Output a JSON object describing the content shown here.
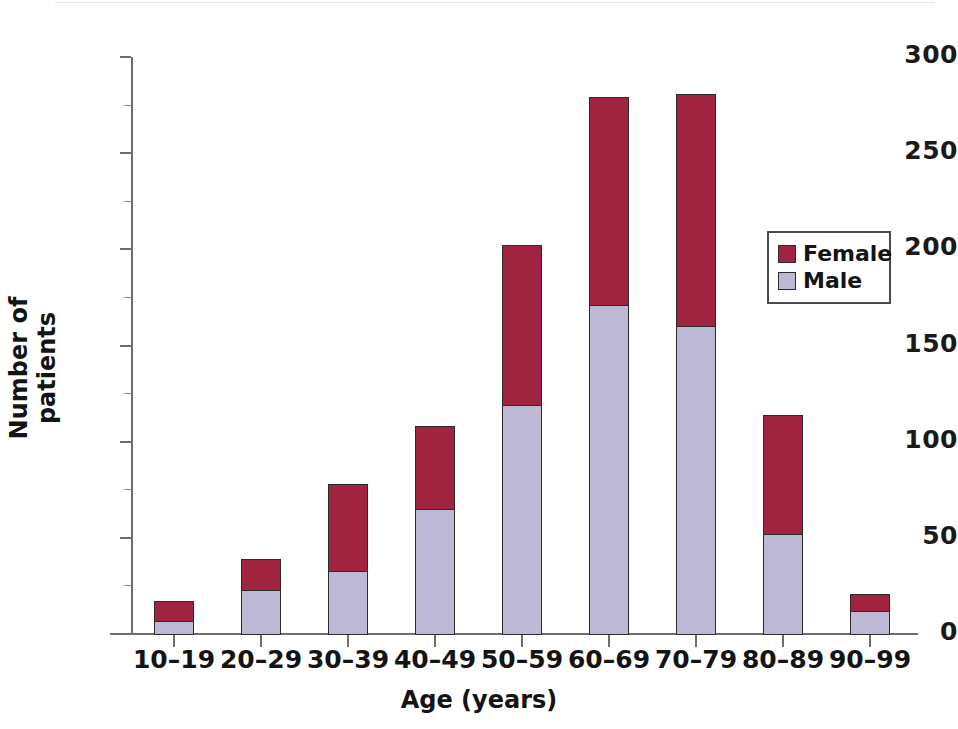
{
  "chart_data": {
    "type": "bar",
    "subtype": "stacked-vertical",
    "title": "",
    "xlabel": "Age (years)",
    "ylabel": "Number of patients",
    "categories": [
      "10–19",
      "20–29",
      "30–39",
      "40–49",
      "50–59",
      "60–69",
      "70–79",
      "80–89",
      "90–99"
    ],
    "series": [
      {
        "name": "Male",
        "values": [
          7,
          23,
          33,
          65,
          119,
          171,
          160,
          52,
          12
        ],
        "color": "#bdb8d4"
      },
      {
        "name": "Female",
        "values": [
          10,
          16,
          45,
          43,
          83,
          108,
          121,
          62,
          9
        ],
        "color": "#a0243f"
      }
    ],
    "totals": [
      17,
      39,
      78,
      108,
      202,
      279,
      281,
      114,
      21
    ],
    "ylim": [
      0,
      300
    ],
    "yticks": [
      0,
      50,
      100,
      150,
      200,
      250,
      300
    ],
    "ytick_labels": [
      "0",
      "50",
      "100",
      "150",
      "200",
      "250",
      "300"
    ],
    "yticks_minor": [
      25,
      75,
      125,
      175,
      225,
      275
    ],
    "grid": false,
    "legend_position": "upper right",
    "legend_entries": [
      "Female",
      "Male"
    ],
    "stack_order_bottom_to_top": [
      "Male",
      "Female"
    ]
  },
  "legend": {
    "items": [
      {
        "label": "Female",
        "color": "#a0243f"
      },
      {
        "label": "Male",
        "color": "#bdb8d4"
      }
    ]
  },
  "axes": {
    "x_title": "Age (years)",
    "y_title": "Number of patients"
  },
  "colors": {
    "female": "#a0243f",
    "male": "#bdb8d4",
    "axis": "#6e6e6e",
    "text": "#141414",
    "bar_outline": "#2b2b2b",
    "background": "#ffffff"
  }
}
